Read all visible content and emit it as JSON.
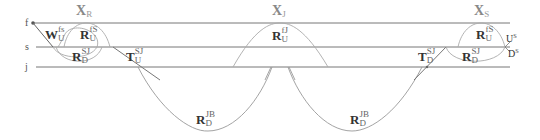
{
  "lines": [
    {
      "id": "f",
      "label": "f",
      "y": 23
    },
    {
      "id": "s",
      "label": "s",
      "y": 47
    },
    {
      "id": "j",
      "label": "j",
      "y": 67
    }
  ],
  "headers": {
    "xr": {
      "base": "X",
      "sub": "R"
    },
    "xj": {
      "base": "X",
      "sub": "J"
    },
    "xs": {
      "base": "X",
      "sub": "S"
    }
  },
  "labels": {
    "w_fs_u": {
      "base": "W",
      "sup": "fs",
      "sub": "U"
    },
    "r_fs_u_left": {
      "base": "R",
      "sup": "fS",
      "sub": "U"
    },
    "r_sj_d_left": {
      "base": "R",
      "sup": "SJ",
      "sub": "D"
    },
    "t_sj_u": {
      "base": "T",
      "sup": "SJ",
      "sub": "U"
    },
    "r_fj_u": {
      "base": "R",
      "sup": "fJ",
      "sub": "U"
    },
    "r_jb_d_left": {
      "base": "R",
      "sup": "JB",
      "sub": "D"
    },
    "r_jb_d_right": {
      "base": "R",
      "sup": "JB",
      "sub": "D"
    },
    "t_sj_d": {
      "base": "T",
      "sup": "SJ",
      "sub": "D"
    },
    "r_fs_u_right": {
      "base": "R",
      "sup": "fS",
      "sub": "U"
    },
    "r_sj_d_right": {
      "base": "R",
      "sup": "SJ",
      "sub": "D"
    },
    "u_s": {
      "base": "U",
      "sup": "s"
    },
    "d_s": {
      "base": "D",
      "sup": "s"
    }
  },
  "colors": {
    "line": "#777777",
    "curve": "#999999",
    "text": "#333333",
    "header": "#888888"
  }
}
